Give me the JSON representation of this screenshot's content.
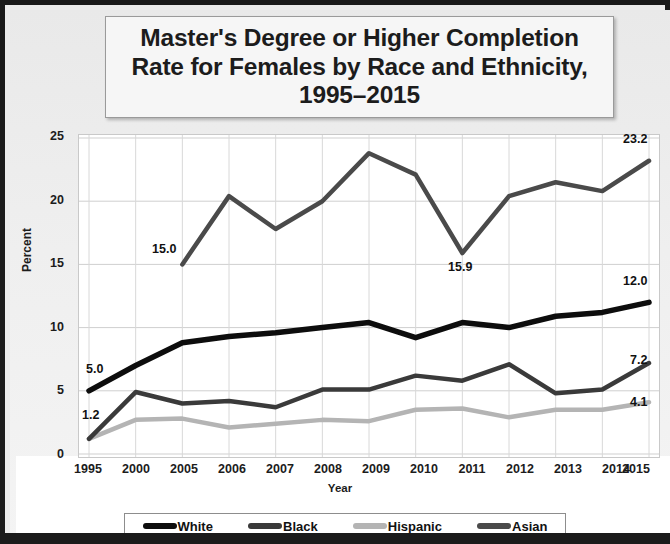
{
  "title": "Master's Degree or Higher Completion Rate for Females by Race and Ethnicity, 1995–2015",
  "axis": {
    "ylabel": "Percent",
    "xlabel": "Year",
    "yticks": [
      "25",
      "20",
      "15",
      "10",
      "5",
      "0"
    ]
  },
  "legend": {
    "items": [
      {
        "label": "White",
        "color": "#0d0d0d"
      },
      {
        "label": "Black",
        "color": "#3a3a3a"
      },
      {
        "label": "Hispanic",
        "color": "#b4b4b4"
      },
      {
        "label": "Asian",
        "color": "#4a4a4a"
      }
    ]
  },
  "annotations": [
    {
      "text": "5.0",
      "x": 76,
      "y": 360
    },
    {
      "text": "1.2",
      "x": 72,
      "y": 404
    },
    {
      "text": "15.0",
      "x": 146,
      "y": 238
    },
    {
      "text": "15.9",
      "x": 440,
      "y": 253
    },
    {
      "text": "23.2",
      "x": 615,
      "y": 127
    },
    {
      "text": "12.0",
      "x": 615,
      "y": 269
    },
    {
      "text": "7.2",
      "x": 622,
      "y": 348
    },
    {
      "text": "4.1",
      "x": 622,
      "y": 388
    }
  ],
  "chart_data": {
    "type": "line",
    "title": "Master's Degree or Higher Completion Rate for Females by Race and Ethnicity, 1995–2015",
    "xlabel": "Year",
    "ylabel": "Percent",
    "ylim": [
      0,
      25
    ],
    "yticks": [
      0,
      5,
      10,
      15,
      20,
      25
    ],
    "grid": true,
    "legend_position": "bottom",
    "categories": [
      "1995",
      "2000",
      "2005",
      "2006",
      "2007",
      "2008",
      "2009",
      "2010",
      "2011",
      "2012",
      "2013",
      "2014",
      "2015"
    ],
    "series": [
      {
        "name": "White",
        "color": "#0d0d0d",
        "values": [
          5.0,
          7.0,
          8.8,
          9.3,
          9.6,
          10.0,
          10.4,
          9.2,
          10.4,
          10.0,
          10.9,
          11.2,
          12.0
        ],
        "labels": {
          "1995": "5.0",
          "2015": "12.0"
        }
      },
      {
        "name": "Black",
        "color": "#3a3a3a",
        "values": [
          1.2,
          4.9,
          4.0,
          4.2,
          3.7,
          5.1,
          5.1,
          6.2,
          5.8,
          7.1,
          4.8,
          5.1,
          7.2
        ],
        "labels": {
          "1995": "1.2",
          "2015": "7.2"
        }
      },
      {
        "name": "Hispanic",
        "color": "#b4b4b4",
        "values": [
          1.2,
          2.7,
          2.8,
          2.1,
          2.4,
          2.7,
          2.6,
          3.5,
          3.6,
          2.9,
          3.5,
          3.5,
          4.1
        ],
        "labels": {
          "2015": "4.1"
        }
      },
      {
        "name": "Asian",
        "color": "#4a4a4a",
        "values": [
          null,
          null,
          15.0,
          20.4,
          17.8,
          20.0,
          23.8,
          22.1,
          15.9,
          20.4,
          21.5,
          20.8,
          23.2
        ],
        "labels": {
          "2005": "15.0",
          "2011": "15.9",
          "2015": "23.2"
        }
      }
    ]
  }
}
